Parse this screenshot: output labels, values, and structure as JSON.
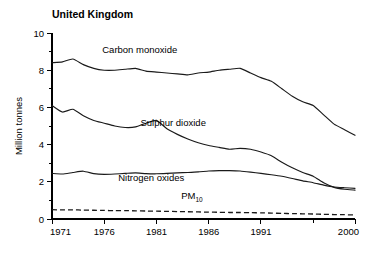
{
  "chart_data": {
    "type": "line",
    "title": "United Kingdom",
    "xlabel": "",
    "ylabel": "Million tonnes",
    "xlim": [
      1971,
      2000
    ],
    "ylim": [
      0,
      10
    ],
    "grid": false,
    "legend_position": "inline-labels",
    "x_ticks": [
      "1971",
      "1976",
      "1981",
      "1986",
      "1991",
      "2000"
    ],
    "x_tick_values": [
      1971,
      1976,
      1981,
      1986,
      1991,
      2000
    ],
    "x_minor_ticks": [
      1996
    ],
    "y_ticks": [
      "0",
      "2",
      "4",
      "6",
      "8",
      "10"
    ],
    "y_tick_values": [
      0,
      2,
      4,
      6,
      8,
      10
    ],
    "y_minor_ticks": [
      1,
      3,
      5,
      7,
      9
    ],
    "x": [
      1971,
      1972,
      1973,
      1974,
      1975,
      1976,
      1977,
      1978,
      1979,
      1980,
      1981,
      1982,
      1983,
      1984,
      1985,
      1986,
      1987,
      1988,
      1989,
      1990,
      1991,
      1992,
      1993,
      1994,
      1995,
      1996,
      1997,
      1998,
      1999,
      2000
    ],
    "series": [
      {
        "name": "Carbon monoxide",
        "style": "solid",
        "label_x": 1979.4,
        "label_y": 8.95,
        "values": [
          8.4,
          8.45,
          8.6,
          8.3,
          8.1,
          8.0,
          8.0,
          8.05,
          8.1,
          7.95,
          7.9,
          7.85,
          7.8,
          7.75,
          7.85,
          7.9,
          8.0,
          8.05,
          8.1,
          7.85,
          7.6,
          7.4,
          7.0,
          6.6,
          6.3,
          6.1,
          5.6,
          5.1,
          4.8,
          4.5
        ]
      },
      {
        "name": "Sulphur dioxide",
        "style": "solid",
        "label_x": 1982.6,
        "label_y": 5.0,
        "values": [
          6.1,
          5.75,
          5.9,
          5.55,
          5.3,
          5.15,
          5.0,
          4.92,
          4.95,
          5.15,
          5.3,
          4.85,
          4.55,
          4.3,
          4.1,
          3.95,
          3.85,
          3.75,
          3.8,
          3.75,
          3.6,
          3.4,
          3.05,
          2.75,
          2.5,
          2.3,
          1.95,
          1.7,
          1.6,
          1.55
        ]
      },
      {
        "name": "Nitrogen oxides",
        "style": "solid",
        "label_x": 1980.5,
        "label_y": 2.05,
        "values": [
          2.45,
          2.42,
          2.5,
          2.57,
          2.44,
          2.4,
          2.42,
          2.45,
          2.48,
          2.44,
          2.43,
          2.45,
          2.48,
          2.5,
          2.53,
          2.58,
          2.6,
          2.6,
          2.58,
          2.52,
          2.45,
          2.38,
          2.3,
          2.18,
          2.05,
          1.95,
          1.82,
          1.72,
          1.68,
          1.65
        ]
      },
      {
        "name": "PM10",
        "label_main": "PM",
        "label_sub": "10",
        "style": "dashed",
        "label_x": 1984.4,
        "label_y": 1.05,
        "values": [
          0.5,
          0.49,
          0.49,
          0.48,
          0.47,
          0.46,
          0.45,
          0.45,
          0.44,
          0.43,
          0.42,
          0.41,
          0.4,
          0.39,
          0.38,
          0.37,
          0.36,
          0.35,
          0.35,
          0.34,
          0.33,
          0.32,
          0.3,
          0.29,
          0.28,
          0.27,
          0.25,
          0.24,
          0.23,
          0.22
        ]
      }
    ]
  },
  "colors": {
    "line": "#1a1a1a",
    "axis": "#000000",
    "background": "#ffffff"
  }
}
